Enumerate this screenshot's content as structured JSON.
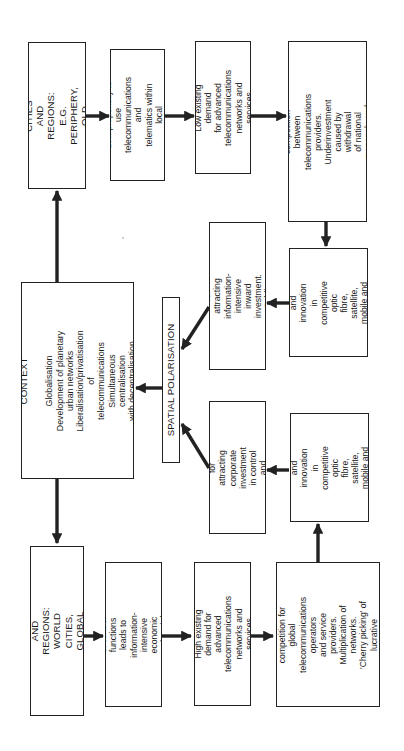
{
  "diagram": {
    "type": "flowchart",
    "orientation": "rotated-90-ccw",
    "nodes": {
      "less_favoured": {
        "label": "LESS-FAVOURED CITIES\nAND REGIONS:\nE.G. PERIPHERY, OLD\nINDUSTRIAL CITIES"
      },
      "low_propensity": {
        "label": "Low propensity to use\ntelecommunications and\ntelematics within local\neconomy"
      },
      "low_demand": {
        "label": "Low existing demand\nfor advanced\ntelecommunications\nnetworks and services"
      },
      "cold_spot": {
        "label": "'Cold spot' status: lack of\ncompetition between\ntelecommunications providers.\nUnderinvestment caused by withdrawal\nof national monopoly and universal\nservice orientation"
      },
      "lack_investment": {
        "label": "Lack of investment\nand innovation in\ncompetitive optic\nfibre, satellite,\nmobile and cable\nnetworks"
      },
      "competitive_disadvantage": {
        "label": "Competitive disadvantage for\nattracting information-intensive\ninward investment. Public\npolicies required"
      },
      "context": {
        "title": "CONTEXT",
        "label": "Globalisation\nDevelopment of planetary\nurban networks\nLiberalisation/privatisation of\ntelecommunications\nSimultaneous centralisation\nwith decentralisation"
      },
      "spatial_polarisation": {
        "label": "SPATIAL POLARISATION"
      },
      "competitive_advantage": {
        "label": "Competitive advantage for\nattracting corporate\ninvestment in control and\ncommand functions"
      },
      "heavy_investment": {
        "label": "Heavy investment\nand innovation in\ncompetitive optic\nfibre, satellite,\nmobile and cable\nnetworks"
      },
      "favoured": {
        "label": "FAVOURED CITIES AND\nREGIONS: WORLD\nCITIES, GLOBAL\nCOMMAND CENTRES"
      },
      "centralisation": {
        "label": "Centralisation of control\nfunctions leads to information-\nintensive economic and social\nstructure"
      },
      "high_demand": {
        "label": "High existing demand for\nadvanced\ntelecommunications\nnetworks and services"
      },
      "hot_spot": {
        "label": "'Hot spot status': intense\ncompetition for global\ntelecommunications operators\nand service providers.\nMultiplication of networks.\n'Cherry picking' of lucrative\ncustomers\nfrom prime markets"
      }
    },
    "edges": [
      [
        "context",
        "less_favoured"
      ],
      [
        "context",
        "favoured"
      ],
      [
        "less_favoured",
        "low_propensity"
      ],
      [
        "low_propensity",
        "low_demand"
      ],
      [
        "low_demand",
        "cold_spot"
      ],
      [
        "cold_spot",
        "lack_investment"
      ],
      [
        "lack_investment",
        "competitive_disadvantage"
      ],
      [
        "competitive_disadvantage",
        "spatial_polarisation"
      ],
      [
        "favoured",
        "centralisation"
      ],
      [
        "centralisation",
        "high_demand"
      ],
      [
        "high_demand",
        "hot_spot"
      ],
      [
        "hot_spot",
        "heavy_investment"
      ],
      [
        "heavy_investment",
        "competitive_advantage"
      ],
      [
        "competitive_advantage",
        "spatial_polarisation"
      ],
      [
        "spatial_polarisation",
        "context"
      ]
    ],
    "colors": {
      "line": "#222222",
      "background": "#ffffff"
    }
  }
}
